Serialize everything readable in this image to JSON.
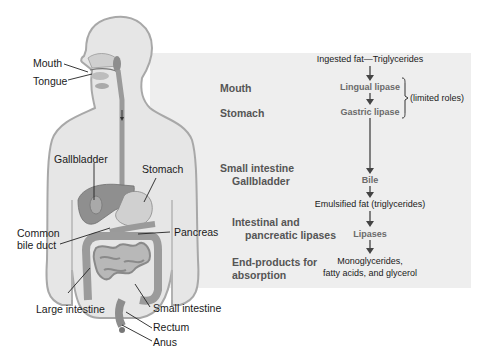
{
  "anatomy_labels": {
    "mouth": "Mouth",
    "tongue": "Tongue",
    "gallbladder": "Gallbladder",
    "stomach": "Stomach",
    "common_bile_duct_line1": "Common",
    "common_bile_duct_line2": "bile duct",
    "pancreas": "Pancreas",
    "large_intestine": "Large intestine",
    "small_intestine": "Small intestine",
    "rectum": "Rectum",
    "anus": "Anus"
  },
  "stages": [
    {
      "label": "Mouth"
    },
    {
      "label": "Stomach"
    },
    {
      "label_line1": "Small intestine",
      "label_line2": "Gallbladder"
    },
    {
      "label_line1": "Intestinal and",
      "label_line2": "pancreatic lipases"
    },
    {
      "label_line1": "End-products for",
      "label_line2": "absorption"
    }
  ],
  "flow": {
    "start": "Ingested fat—Triglycerides",
    "lingual_lipase": "Lingual lipase",
    "gastric_lipase": "Gastric lipase",
    "limited_roles": "(limited roles)",
    "bile": "Bile",
    "emulsified": "Emulsified fat (triglycerides)",
    "lipases": "Lipases",
    "end_line1": "Monoglycerides,",
    "end_line2": "fatty acids, and glycerol"
  },
  "colors": {
    "panel": "#eeeeee",
    "body_fill": "#e6e6e6",
    "body_outline": "#a8a8a8",
    "organ": "#9a9a9a",
    "enzyme_text": "#6a6a6a",
    "stage_text": "#555555"
  }
}
